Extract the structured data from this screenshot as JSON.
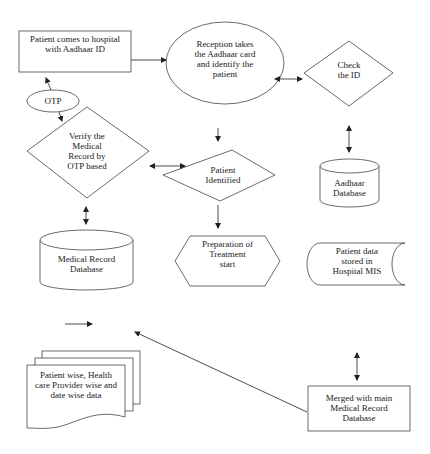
{
  "diagram": {
    "type": "flowchart",
    "stroke_color": "#333333",
    "nodes": {
      "patient_arrives": {
        "shape": "rectangle",
        "text": "Patient comes to hospital\nwith Aadhaar ID"
      },
      "reception": {
        "shape": "ellipse",
        "text": "Reception takes\nthe Aadhaar card\nand identify the\npatient"
      },
      "check_id": {
        "shape": "diamond",
        "text": "Check\nthe ID"
      },
      "otp": {
        "shape": "ellipse",
        "text": "OTP"
      },
      "verify_record": {
        "shape": "diamond",
        "text": "Verify the\nMedical\nRecord by\nOTP based"
      },
      "patient_identified": {
        "shape": "diamond",
        "text": "Patient\nIdentified"
      },
      "aadhaar_db": {
        "shape": "cylinder",
        "text": "Aadhaar\nDatabase"
      },
      "medical_record_db": {
        "shape": "cylinder",
        "text": "Medical Record\nDatabase"
      },
      "treatment": {
        "shape": "hexagon",
        "text": "Preparation of\nTreatment\nstart"
      },
      "hospital_mis": {
        "shape": "stored-data",
        "text": "Patient data\nstored in\nHospital MIS"
      },
      "reports": {
        "shape": "multi-document",
        "text": "Patient wise, Health\ncare Provider wise and\ndate wise data"
      },
      "merged": {
        "shape": "rectangle",
        "text": "Merged with main\nMedical Record\nDatabase"
      }
    },
    "edges": [
      {
        "from": "patient_arrives",
        "to": "reception",
        "style": "single-arrow"
      },
      {
        "from": "reception",
        "to": "check_id",
        "style": "double-arrow"
      },
      {
        "from": "otp",
        "to": "patient_arrives",
        "style": "single-arrow"
      },
      {
        "from": "otp",
        "to": "verify_record",
        "style": "single-arrow"
      },
      {
        "from": "reception",
        "to": "patient_identified",
        "style": "single-arrow"
      },
      {
        "from": "verify_record",
        "to": "patient_identified",
        "style": "double-arrow"
      },
      {
        "from": "check_id",
        "to": "aadhaar_db",
        "style": "double-arrow"
      },
      {
        "from": "verify_record",
        "to": "medical_record_db",
        "style": "double-arrow"
      },
      {
        "from": "patient_identified",
        "to": "treatment",
        "style": "single-arrow"
      },
      {
        "from": "hospital_mis",
        "to": "merged",
        "style": "double-arrow"
      },
      {
        "from": "merged",
        "to": "reports",
        "style": "single-arrow"
      }
    ]
  }
}
